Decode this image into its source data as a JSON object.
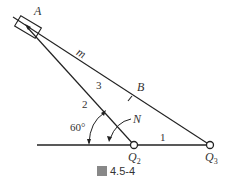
{
  "labels": {
    "A": "A",
    "m": "m",
    "B": "B",
    "N": "N",
    "Q2_main": "Q",
    "Q2_sub": "2",
    "Q3_main": "Q",
    "Q3_sub": "3",
    "link1": "1",
    "link2": "2",
    "link3": "3",
    "angle": "60°"
  },
  "caption": {
    "prefix": "圖",
    "number": "4.5-4"
  },
  "colors": {
    "line": "#222222",
    "text": "#333333",
    "caption_box": "#888888"
  }
}
